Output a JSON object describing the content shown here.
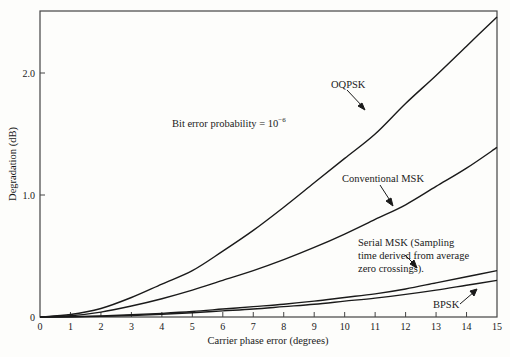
{
  "chart_data": {
    "type": "line",
    "title": "",
    "annotation": "Bit error probability = 10^-6",
    "annotation_base": "Bit error probability = 10",
    "annotation_exp": "−6",
    "xlabel": "Carrier phase error (degrees)",
    "ylabel": "Degradation (dB)",
    "xlim": [
      0,
      15
    ],
    "ylim": [
      0,
      2.5
    ],
    "x_ticks": [
      "0",
      "1",
      "2",
      "3",
      "4",
      "5",
      "6",
      "7",
      "8",
      "9",
      "10",
      "11",
      "12",
      "13",
      "14",
      "15"
    ],
    "y_ticks": [
      {
        "value": 0,
        "label": "0"
      },
      {
        "value": 1.0,
        "label": "1.0"
      },
      {
        "value": 2.0,
        "label": "2.0"
      }
    ],
    "grid": false,
    "legend": "inline labels with arrows",
    "x": [
      0,
      1,
      2,
      3,
      4,
      5,
      6,
      7,
      8,
      9,
      10,
      11,
      12,
      13,
      14,
      15
    ],
    "series": [
      {
        "name": "OQPSK",
        "values": [
          0,
          0.02,
          0.07,
          0.16,
          0.27,
          0.38,
          0.54,
          0.71,
          0.9,
          1.1,
          1.3,
          1.5,
          1.75,
          1.98,
          2.22,
          2.46
        ]
      },
      {
        "name": "Conventional MSK",
        "values": [
          0,
          0.01,
          0.04,
          0.09,
          0.15,
          0.22,
          0.3,
          0.38,
          0.47,
          0.57,
          0.68,
          0.8,
          0.92,
          1.07,
          1.22,
          1.39
        ]
      },
      {
        "name": "Serial MSK (Sampling time derived from average zero crossings).",
        "values": [
          0,
          0.002,
          0.008,
          0.018,
          0.03,
          0.045,
          0.065,
          0.085,
          0.105,
          0.13,
          0.16,
          0.19,
          0.23,
          0.28,
          0.33,
          0.38
        ]
      },
      {
        "name": "BPSK",
        "values": [
          0,
          0.001,
          0.005,
          0.012,
          0.022,
          0.035,
          0.05,
          0.065,
          0.085,
          0.105,
          0.13,
          0.155,
          0.185,
          0.22,
          0.26,
          0.3
        ]
      }
    ]
  },
  "labels": {
    "oqpsk": "OQPSK",
    "conv_msk": "Conventional MSK",
    "serial_msk_1": "Serial MSK (Sampling",
    "serial_msk_2": "time derived from average",
    "serial_msk_3": "zero crossings).",
    "bpsk": "BPSK"
  }
}
